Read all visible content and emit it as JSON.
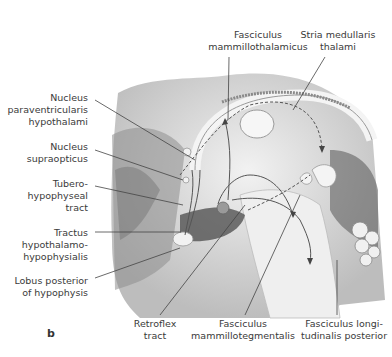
{
  "figure": {
    "panel_label": "b",
    "labels": {
      "fasciculus_mammillothalamicus": [
        "Fasciculus",
        "mammillothalamicus"
      ],
      "stria_medullaris_thalami": [
        "Stria medullaris",
        "thalami"
      ],
      "nucleus_paraventricularis": [
        "Nucleus",
        "paraventricularis",
        "hypothalami"
      ],
      "nucleus_supraopticus": [
        "Nucleus",
        "supraopticus"
      ],
      "tuberohypophyseal_tract": [
        "Tubero-",
        "hypophyseal",
        "tract"
      ],
      "tractus_hypothalamohypophysialis": [
        "Tractus",
        "hypothalamo-",
        "hypophysialis"
      ],
      "lobus_posterior": [
        "Lobus posterior",
        "of hypophysis"
      ],
      "retroflex_tract": [
        "Retroflex",
        "tract"
      ],
      "fasciculus_mammillotegmentalis": [
        "Fasciculus",
        "mammillotegmentalis"
      ],
      "fasciculus_longitudinalis_posterior": [
        "Fasciculus longi-",
        "tudinalis posterior"
      ]
    }
  }
}
